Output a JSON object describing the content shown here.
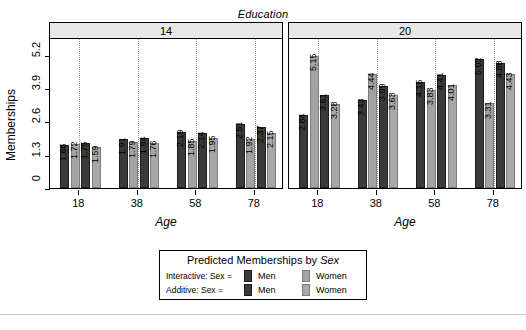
{
  "figure": {
    "facet_variable_label": "Education",
    "y_axis_title": "Memberships",
    "x_axis_title_left": "Age",
    "x_axis_title_right": "Age"
  },
  "legend": {
    "title_prefix": "Predicted Memberships by ",
    "title_variable": "Sex",
    "rows": [
      {
        "label": "Interactive: Sex =",
        "keys": [
          {
            "label": "Men",
            "style": "interactive-men",
            "color": "#3a3a3a"
          },
          {
            "label": "Women",
            "style": "interactive-women",
            "color": "#a3a3a3"
          }
        ]
      },
      {
        "label": "Additive: Sex =",
        "keys": [
          {
            "label": "Men",
            "style": "additive-men",
            "color": "#3a3a3a"
          },
          {
            "label": "Women",
            "style": "additive-women",
            "color": "#a8a8a8"
          }
        ]
      }
    ]
  },
  "chart_data": {
    "type": "bar",
    "title": "Predicted Memberships by Sex",
    "xlabel": "Age",
    "ylabel": "Memberships",
    "facet_label": "Education",
    "ylim": [
      0,
      5.85
    ],
    "yticks": [
      0,
      1.3,
      2.6,
      3.9,
      5.2
    ],
    "ytick_labels": [
      "0",
      "1.3",
      "2.6",
      "3.9",
      "5.2"
    ],
    "grid": "vertical-dotted",
    "legend_position": "bottom",
    "categories": [
      18,
      38,
      58,
      78
    ],
    "category_labels": [
      "18",
      "38",
      "58",
      "78"
    ],
    "series": [
      {
        "name": "Interactive: Sex = Men",
        "style": "interactive-men"
      },
      {
        "name": "Interactive: Sex = Women",
        "style": "interactive-women"
      },
      {
        "name": "Additive: Sex = Men",
        "style": "additive-men"
      },
      {
        "name": "Additive: Sex = Women",
        "style": "additive-women"
      }
    ],
    "panels": [
      {
        "facet_value": "14",
        "groups": [
          {
            "category": "18",
            "values": [
              1.66,
              1.72,
              1.75,
              1.59
            ]
          },
          {
            "category": "38",
            "values": [
              1.91,
              1.79,
              1.94,
              1.76
            ]
          },
          {
            "category": "58",
            "values": [
              2.19,
              1.85,
              2.14,
              1.95
            ]
          },
          {
            "category": "78",
            "values": [
              2.51,
              1.92,
              2.37,
              2.15
            ]
          }
        ]
      },
      {
        "facet_value": "20",
        "groups": [
          {
            "category": "18",
            "values": [
              2.84,
              5.15,
              3.61,
              3.28
            ]
          },
          {
            "category": "38",
            "values": [
              3.43,
              4.44,
              3.99,
              3.63
            ]
          },
          {
            "category": "58",
            "values": [
              4.15,
              3.83,
              4.41,
              4.01
            ]
          },
          {
            "category": "78",
            "values": [
              5.02,
              3.31,
              4.88,
              4.43
            ]
          }
        ]
      }
    ]
  }
}
